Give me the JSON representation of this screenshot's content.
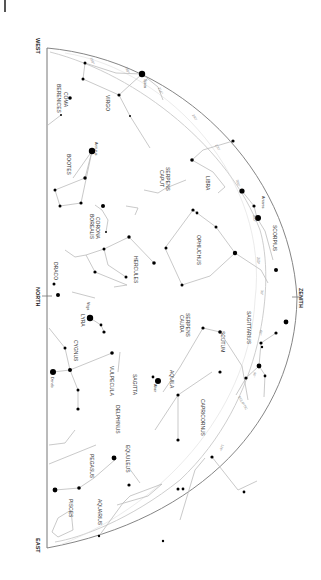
{
  "chart": {
    "orientation": "rotated 90° clockwise — horizon on the left, zenith on the right",
    "directions": {
      "west": "WEST",
      "north": "NORTH",
      "east": "EAST",
      "zenith": "ZENITH"
    },
    "ecliptic_label": "ECLIPTIC",
    "ecliptic_ticks": [
      "150°",
      "180°",
      "210°",
      "240°",
      "270°",
      "300°",
      "330°",
      "360°",
      "30°",
      "60°",
      "90°",
      "120°"
    ],
    "constellations": [
      {
        "name": "COMA BERENICES",
        "lines": [
          "COMA",
          "BERENICES"
        ]
      },
      {
        "name": "VIRGO"
      },
      {
        "name": "BOOTES"
      },
      {
        "name": "CORONA BOREALIS",
        "lines": [
          "CORONA",
          "BOREALIS"
        ]
      },
      {
        "name": "SERPENS CAPUT",
        "lines": [
          "SERPENS",
          "CAPUT"
        ]
      },
      {
        "name": "LIBRA"
      },
      {
        "name": "SCORPIUS"
      },
      {
        "name": "OPHIUCHUS"
      },
      {
        "name": "HERCULES"
      },
      {
        "name": "DRACO"
      },
      {
        "name": "LYRA"
      },
      {
        "name": "CYGNUS"
      },
      {
        "name": "SERPENS CAUDA",
        "lines": [
          "SERPENS",
          "CAUDA"
        ]
      },
      {
        "name": "SCUTUM"
      },
      {
        "name": "SAGITTARIUS"
      },
      {
        "name": "AQUILA"
      },
      {
        "name": "SAGITTA"
      },
      {
        "name": "VULPECULA"
      },
      {
        "name": "DELPHINUS"
      },
      {
        "name": "CAPRICORNUS"
      },
      {
        "name": "EQUULEUS"
      },
      {
        "name": "PEGASUS"
      },
      {
        "name": "AQUARIUS"
      },
      {
        "name": "PISCES"
      }
    ],
    "bright_stars": [
      "Spica",
      "Arcturus",
      "Antares",
      "Vega",
      "Deneb",
      "Altair"
    ],
    "colors": {
      "background": "#ffffff",
      "horizon_line": "#777777",
      "constellation_lines": "#bbbbbb",
      "ecliptic": "#c8c8c8",
      "stars": "#000000",
      "text": "#333333"
    }
  }
}
